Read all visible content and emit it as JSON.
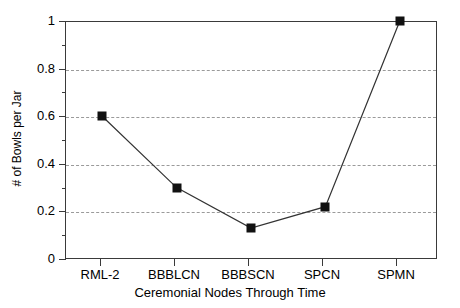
{
  "chart_data": {
    "type": "line",
    "title": "",
    "subtitle": "",
    "xlabel": "Ceremonial Nodes Through Time",
    "ylabel": "# of Bowls per Jar",
    "categories": [
      "RML-2",
      "BBBLCN",
      "BBBSCN",
      "SPCN",
      "SPMN"
    ],
    "values": [
      0.6,
      0.3,
      0.13,
      0.22,
      1.0
    ],
    "series": [
      {
        "name": "# of Bowls per Jar",
        "values": [
          0.6,
          0.3,
          0.13,
          0.22,
          1.0
        ]
      }
    ],
    "ylim": [
      0,
      1
    ],
    "yticks": [
      0,
      0.2,
      0.4,
      0.6,
      0.8,
      1
    ],
    "ytick_labels": [
      "0",
      "0.2",
      "0.4",
      "0.6",
      "0.8",
      "1"
    ],
    "yminor_ticks": [
      0.1,
      0.3,
      0.5,
      0.7,
      0.9
    ],
    "grid": true,
    "grid_axis": "y",
    "grid_style": "dashed",
    "legend": false,
    "legend_position": "none",
    "marker": "square",
    "marker_color": "#111111",
    "line_color": "#333333"
  },
  "axis": {
    "y_title": "# of Bowls per Jar",
    "x_title": "Ceremonial Nodes Through Time",
    "y_labels": [
      "1",
      "0.8",
      "0.6",
      "0.4",
      "0.2",
      "0"
    ],
    "x_labels": [
      "RML-2",
      "BBBLCN",
      "BBBSCN",
      "SPCN",
      "SPMN"
    ]
  },
  "colors": {
    "frame": "#3a3a3a",
    "grid": "#9a9a9a",
    "line": "#333333",
    "marker": "#111111",
    "background": "#ffffff"
  }
}
